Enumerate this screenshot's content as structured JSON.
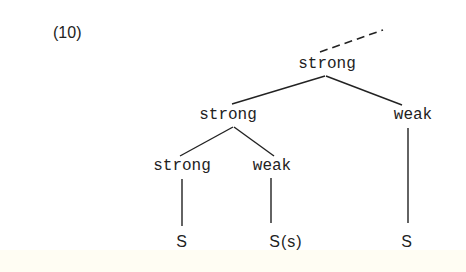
{
  "example_number": "(10)",
  "tree": {
    "root": {
      "label": "strong"
    },
    "left": {
      "label": "strong"
    },
    "right": {
      "label": "weak"
    },
    "left_left": {
      "label": "strong"
    },
    "left_right": {
      "label": "weak"
    },
    "leaves": [
      {
        "label": "S"
      },
      {
        "label": "S(s)"
      },
      {
        "label": "S"
      }
    ]
  },
  "colors": {
    "ink": "#222222",
    "background": "#ffffff",
    "bottom_band": "#fffdf3"
  }
}
